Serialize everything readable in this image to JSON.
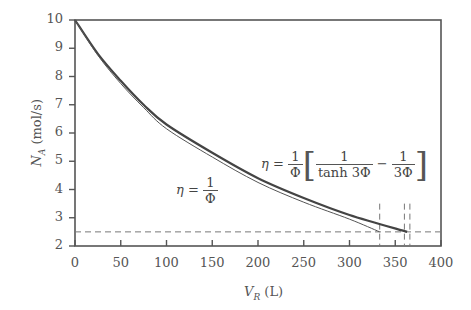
{
  "chart_data": {
    "type": "line",
    "title": "",
    "xlabel": "V_R (L)",
    "ylabel": "N_A (mol/s)",
    "xlim": [
      0,
      400
    ],
    "ylim": [
      2,
      10
    ],
    "xticks": [
      0,
      50,
      100,
      150,
      200,
      250,
      300,
      350,
      400
    ],
    "yticks": [
      2,
      3,
      4,
      5,
      6,
      7,
      8,
      9,
      10
    ],
    "grid": false,
    "legend": "none (inline annotations)",
    "series": [
      {
        "name": "η = (1/Φ)[1/tanh 3Φ − 1/(3Φ)]",
        "style": "thick solid",
        "x": [
          0,
          25,
          50,
          75,
          100,
          150,
          200,
          250,
          300,
          363
        ],
        "y": [
          10,
          8.8,
          7.85,
          7.0,
          6.3,
          5.3,
          4.4,
          3.7,
          3.1,
          2.5
        ]
      },
      {
        "name": "η = 1/Φ",
        "style": "thin solid",
        "x": [
          0,
          25,
          50,
          75,
          100,
          150,
          200,
          250,
          300,
          333
        ],
        "y": [
          10,
          8.75,
          7.75,
          6.9,
          6.15,
          5.15,
          4.25,
          3.55,
          2.95,
          2.5
        ]
      }
    ],
    "reference_lines": {
      "horizontal_dashed": [
        2.5
      ],
      "vertical_dashed": [
        333,
        360,
        366
      ]
    },
    "annotations": [
      {
        "text": "η = 1/Φ",
        "x": 140,
        "y": 3.9
      },
      {
        "text": "η = (1/Φ)[1/tanh 3Φ − 1/(3Φ)]",
        "x": 280,
        "y": 4.4
      }
    ]
  },
  "labels": {
    "xlabel_var": "V",
    "xlabel_sub": "R",
    "xlabel_unit": " (L)",
    "ylabel_var": "N",
    "ylabel_sub": "A",
    "ylabel_unit": " (mol/s)",
    "eq1_lhs": "η = ",
    "eq1_num": "1",
    "eq1_den": "Φ",
    "eq2_lhs": "η = ",
    "eq2_num": "1",
    "eq2_den": "Φ",
    "eq2_open": "[",
    "eq2_t1_num": "1",
    "eq2_t1_den": "tanh 3Φ",
    "eq2_minus": " − ",
    "eq2_t2_num": "1",
    "eq2_t2_den": "3Φ",
    "eq2_close": "]"
  }
}
